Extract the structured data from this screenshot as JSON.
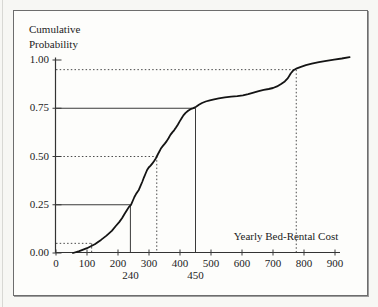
{
  "figure": {
    "title_line1": "Cumulative",
    "title_line2": "Probability",
    "x_axis_caption": "Yearly Bed-Rental Cost"
  },
  "chart_data": {
    "type": "line",
    "title": "Cumulative Probability",
    "xlabel": "Yearly Bed-Rental Cost",
    "ylabel": "Cumulative Probability",
    "xlim": [
      0,
      950
    ],
    "ylim": [
      0,
      1.0
    ],
    "grid": false,
    "legend": null,
    "line_color": "#141414",
    "guide_solid_color": "#3a3a3a",
    "guide_dotted_color": "#4a4a4a",
    "x_ticks": [
      0,
      100,
      200,
      300,
      400,
      500,
      600,
      700,
      800,
      900
    ],
    "x_tick_labels": [
      "0",
      "100",
      "200",
      "300",
      "400",
      "500",
      "600",
      "700",
      "800",
      "900"
    ],
    "y_ticks": [
      0,
      0.25,
      0.5,
      0.75,
      1.0
    ],
    "y_tick_labels": [
      "0.00",
      "0.25",
      "0.50",
      "0.75",
      "1.00"
    ],
    "fractiles": [
      {
        "p": 0.05,
        "x": 115,
        "line": "dotted",
        "label": ""
      },
      {
        "p": 0.25,
        "x": 240,
        "line": "solid",
        "label": "240"
      },
      {
        "p": 0.5,
        "x": 325,
        "line": "dotted",
        "label": ""
      },
      {
        "p": 0.75,
        "x": 450,
        "line": "solid",
        "label": "450"
      },
      {
        "p": 0.95,
        "x": 775,
        "line": "dotted",
        "label": ""
      }
    ],
    "curve_points": [
      [
        55,
        0
      ],
      [
        75,
        0.01
      ],
      [
        100,
        0.025
      ],
      [
        125,
        0.045
      ],
      [
        145,
        0.068
      ],
      [
        163,
        0.09
      ],
      [
        180,
        0.115
      ],
      [
        193,
        0.14
      ],
      [
        204,
        0.16
      ],
      [
        213,
        0.18
      ],
      [
        221,
        0.202
      ],
      [
        228,
        0.22
      ],
      [
        235,
        0.238
      ],
      [
        242,
        0.25
      ],
      [
        248,
        0.272
      ],
      [
        253,
        0.29
      ],
      [
        258,
        0.305
      ],
      [
        262,
        0.315
      ],
      [
        267,
        0.327
      ],
      [
        272,
        0.345
      ],
      [
        278,
        0.368
      ],
      [
        284,
        0.392
      ],
      [
        289,
        0.412
      ],
      [
        294,
        0.43
      ],
      [
        299,
        0.443
      ],
      [
        305,
        0.453
      ],
      [
        311,
        0.464
      ],
      [
        317,
        0.478
      ],
      [
        322,
        0.49
      ],
      [
        325,
        0.5
      ],
      [
        329,
        0.513
      ],
      [
        334,
        0.527
      ],
      [
        339,
        0.543
      ],
      [
        345,
        0.555
      ],
      [
        351,
        0.567
      ],
      [
        357,
        0.58
      ],
      [
        363,
        0.595
      ],
      [
        369,
        0.612
      ],
      [
        375,
        0.625
      ],
      [
        381,
        0.636
      ],
      [
        387,
        0.65
      ],
      [
        393,
        0.665
      ],
      [
        399,
        0.682
      ],
      [
        405,
        0.698
      ],
      [
        411,
        0.713
      ],
      [
        418,
        0.726
      ],
      [
        426,
        0.737
      ],
      [
        434,
        0.745
      ],
      [
        443,
        0.751
      ],
      [
        452,
        0.758
      ],
      [
        461,
        0.768
      ],
      [
        471,
        0.777
      ],
      [
        483,
        0.785
      ],
      [
        496,
        0.791
      ],
      [
        510,
        0.796
      ],
      [
        525,
        0.801
      ],
      [
        545,
        0.806
      ],
      [
        565,
        0.81
      ],
      [
        585,
        0.813
      ],
      [
        603,
        0.817
      ],
      [
        620,
        0.823
      ],
      [
        637,
        0.831
      ],
      [
        654,
        0.839
      ],
      [
        670,
        0.845
      ],
      [
        686,
        0.85
      ],
      [
        700,
        0.855
      ],
      [
        713,
        0.863
      ],
      [
        726,
        0.876
      ],
      [
        738,
        0.889
      ],
      [
        748,
        0.906
      ],
      [
        757,
        0.93
      ],
      [
        766,
        0.947
      ],
      [
        777,
        0.957
      ],
      [
        790,
        0.965
      ],
      [
        806,
        0.973
      ],
      [
        825,
        0.981
      ],
      [
        848,
        0.989
      ],
      [
        872,
        0.996
      ],
      [
        897,
        1.002
      ],
      [
        922,
        1.008
      ],
      [
        947,
        1.015
      ]
    ]
  }
}
